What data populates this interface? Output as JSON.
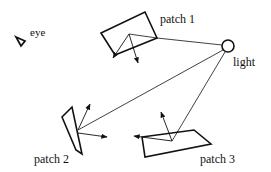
{
  "diagram": {
    "labels": {
      "eye": "eye",
      "patch1": "patch 1",
      "patch2": "patch 2",
      "patch3": "patch 3",
      "light": "light"
    },
    "nodes": [
      {
        "id": "eye",
        "shape": "triangle",
        "label": "eye"
      },
      {
        "id": "light",
        "shape": "circle",
        "label": "light"
      },
      {
        "id": "patch1",
        "shape": "quadrilateral",
        "label": "patch 1"
      },
      {
        "id": "patch2",
        "shape": "quadrilateral",
        "label": "patch 2"
      },
      {
        "id": "patch3",
        "shape": "quadrilateral",
        "label": "patch 3"
      }
    ],
    "edges": [
      {
        "from": "light",
        "to": "patch1",
        "style": "thin line"
      },
      {
        "from": "light",
        "to": "patch2",
        "style": "thin line"
      },
      {
        "from": "light",
        "to": "patch3",
        "style": "thin line"
      }
    ],
    "colors": {
      "stroke": "#111111",
      "background": "#ffffff"
    }
  }
}
